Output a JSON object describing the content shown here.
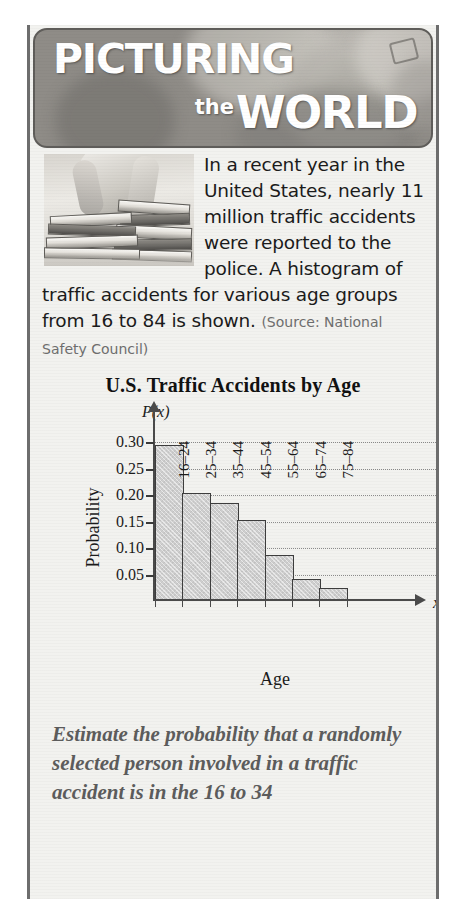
{
  "banner": {
    "line1": "PICTURING",
    "the": "the",
    "world": "WORLD",
    "photo_alt": "student-leaning-on-book-stack"
  },
  "intro": {
    "body": "In a recent year in the United States, nearly 11 million traffic accidents were reported to the police. A histogram of traffic accidents for various age groups from 16 to 84 is shown.",
    "source": "(Source: National Safety Council)"
  },
  "question": {
    "text": "Estimate the probability that a randomly selected person involved in a traffic accident is in the 16 to 34"
  },
  "chart_data": {
    "type": "bar",
    "title": "U.S. Traffic Accidents by Age",
    "xlabel": "Age",
    "ylabel": "Probability",
    "y_axis_symbol": "P(x)",
    "x_axis_symbol": "x",
    "categories": [
      "16–24",
      "25–34",
      "35–44",
      "45–54",
      "55–64",
      "65–74",
      "75–84"
    ],
    "values": [
      0.295,
      0.205,
      0.185,
      0.153,
      0.087,
      0.042,
      0.025
    ],
    "ylim": [
      0,
      0.325
    ],
    "yticks": [
      0.3,
      0.25,
      0.2,
      0.15,
      0.1,
      0.05
    ],
    "ytick_labels": [
      "0.30",
      "0.25",
      "0.20",
      "0.15",
      "0.10",
      "0.05"
    ],
    "grid": true,
    "grid_style": "dotted-horizontal",
    "legend": "none",
    "bar_fill": "#cfcfcf",
    "bar_edge": "#3d3d3d"
  },
  "colors": {
    "banner_text": "#ffffff",
    "box_background": "#f2f2ef",
    "box_border": "#6d6d6d",
    "body_text": "#1b1b1b",
    "source_text": "#6e6e6e",
    "question_text": "#5c5c5c"
  }
}
